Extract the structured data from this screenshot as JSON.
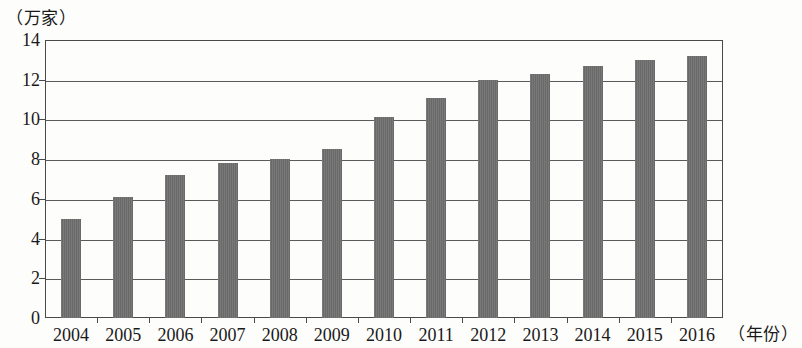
{
  "chart_data": {
    "type": "bar",
    "title": "",
    "subtitle": "",
    "unit_caption": "（万家）",
    "xaxis_caption": "（年份）",
    "xlabel": "年份",
    "ylabel": "万家",
    "categories": [
      "2004",
      "2005",
      "2006",
      "2007",
      "2008",
      "2009",
      "2010",
      "2011",
      "2012",
      "2013",
      "2014",
      "2015",
      "2016"
    ],
    "values": [
      5.0,
      6.1,
      7.2,
      7.8,
      8.0,
      8.5,
      10.1,
      11.1,
      12.0,
      12.3,
      12.7,
      13.0,
      13.2
    ],
    "ylim": [
      0,
      14
    ],
    "ytick_labels": [
      "0",
      "2",
      "4",
      "6",
      "8",
      "10",
      "12",
      "14"
    ],
    "ytick_values": [
      0,
      2,
      4,
      6,
      8,
      10,
      12,
      14
    ],
    "grid": true,
    "legend": false,
    "legend_position": "none",
    "series": [
      {
        "name": "企业数量",
        "values": [
          5.0,
          6.1,
          7.2,
          7.8,
          8.0,
          8.5,
          10.1,
          11.1,
          12.0,
          12.3,
          12.7,
          13.0,
          13.2
        ]
      }
    ],
    "colors": {
      "bar": "#6f6f6f",
      "axis": "#4a4a4a",
      "grid": "#5a5a5a",
      "text": "#191919",
      "background": "#fdfdfb"
    }
  }
}
